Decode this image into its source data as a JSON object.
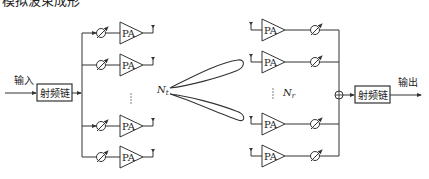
{
  "caption_partial": "模拟波束成形",
  "transmitter": {
    "input_label": "输入",
    "rf_chain_label": "射频链",
    "pa_label": "PA",
    "antenna_count_label": "N",
    "antenna_count_sub": "t",
    "rows": [
      {
        "id": 1,
        "y": 33
      },
      {
        "id": 2,
        "y": 65
      },
      {
        "id": 3,
        "y": 126
      },
      {
        "id": 4,
        "y": 157
      }
    ]
  },
  "receiver": {
    "output_label": "输出",
    "rf_chain_label": "射频链",
    "pa_label": "PA",
    "antenna_count_label": "N",
    "antenna_count_sub": "r",
    "rows": [
      {
        "id": 1,
        "y": 30
      },
      {
        "id": 2,
        "y": 62
      },
      {
        "id": 3,
        "y": 124
      },
      {
        "id": 4,
        "y": 156
      }
    ]
  },
  "colors": {
    "line": "#333333",
    "background": "#ffffff"
  }
}
